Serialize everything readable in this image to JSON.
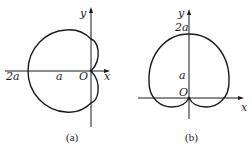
{
  "figure_a": {
    "caption": "(a)",
    "labels": {
      "y_axis": "y",
      "x_axis": "x",
      "origin": "O",
      "two_a": "2a",
      "a": "a"
    }
  },
  "figure_b": {
    "caption": "(b)",
    "labels": {
      "y_axis": "y",
      "x_axis": "x",
      "origin": "O",
      "two_a": "2a",
      "a": "a"
    }
  }
}
